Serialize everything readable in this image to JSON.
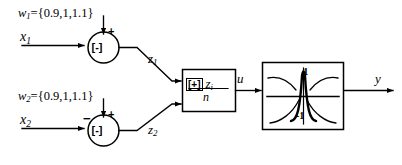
{
  "diagram": {
    "stroke_color": "#000000",
    "background_color": "#ffffff"
  },
  "inputs": [
    {
      "weight_label": "w",
      "weight_subscript": "1",
      "weight_expression": "={0.9,1,1.1}",
      "signal_label": "x",
      "signal_subscript": "1",
      "branch_sign": "",
      "bias_sign": "+",
      "junction_operator": "[-]",
      "output_label": "z",
      "output_subscript": "1"
    },
    {
      "weight_label": "w",
      "weight_subscript": "2",
      "weight_expression": "={0.9,1,1.1}",
      "signal_label": "x",
      "signal_subscript": "2",
      "branch_sign": "−",
      "bias_sign": "+",
      "junction_operator": "[-]",
      "output_label": "z",
      "output_subscript": "2"
    }
  ],
  "averaging_block": {
    "operator_symbol": "[+]",
    "numerator_variable": "z",
    "numerator_subscript": "i",
    "denominator": "n",
    "output_label": "u"
  },
  "transfer_block": {
    "upper_axis_value": "1",
    "lower_axis_value": "-1",
    "output_label": "y"
  }
}
